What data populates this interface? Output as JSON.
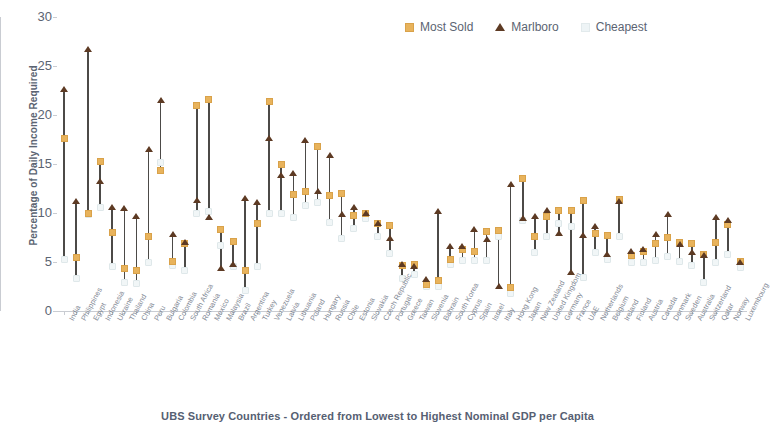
{
  "chart_data": {
    "type": "scatter",
    "title": "",
    "xlabel": "UBS Survey Countries - Ordered from Lowest to Highest Nominal GDP per Capita",
    "ylabel": "Percentage of Daily Income Required",
    "ylim": [
      0,
      30
    ],
    "yticks": [
      0,
      5,
      10,
      15,
      20,
      25,
      30
    ],
    "grid": false,
    "legend_position": "top-right",
    "colors": {
      "most_sold": "#e8b35c",
      "marlboro": "#5d3a23",
      "cheapest": "#eef4f6",
      "stem": "#4c4a47",
      "axis": "#c9ccd2",
      "text": "#5b6472"
    },
    "categories": [
      "India",
      "Philippines",
      "Egypt",
      "Indonesia",
      "Ukraine",
      "Thailand",
      "China",
      "Peru",
      "Bulgaria",
      "Colombia",
      "South Africa",
      "Romania",
      "Mexico",
      "Malaysia",
      "Brazil",
      "Argentina",
      "Turkey",
      "Venezuela",
      "Latvia",
      "Lithuania",
      "Poland",
      "Hungary",
      "Russia",
      "Chile",
      "Estonia",
      "Slovakia",
      "Czech Republic",
      "Portugal",
      "Greece",
      "Taiwan",
      "Slovenia",
      "Bahrain",
      "South Korea",
      "Cyprus",
      "Spain",
      "Israel",
      "Italy",
      "Hong Kong",
      "Japan",
      "New Zealand",
      "United Kingdom",
      "Germany",
      "France",
      "UAE",
      "Netherlands",
      "Belgium",
      "Ireland",
      "Finland",
      "Austria",
      "Canada",
      "Denmark",
      "Sweden",
      "Australia",
      "Switzerland",
      "Qatar",
      "Norway",
      "Luxembourg"
    ],
    "series": [
      {
        "name": "Marlboro",
        "marker": "triangle",
        "color": "#5d3a23",
        "values": [
          22.7,
          11.2,
          26.7,
          13.3,
          10.6,
          10.5,
          9.7,
          16.5,
          21.5,
          7.9,
          7.0,
          11.3,
          9.6,
          4.4,
          4.8,
          11.5,
          11.1,
          17.7,
          13.9,
          14.1,
          17.5,
          12.2,
          15.9,
          9.9,
          10.6,
          10.0,
          9.0,
          7.5,
          4.8,
          4.6,
          3.3,
          10.2,
          6.6,
          6.6,
          8.4,
          7.3,
          2.6,
          13.0,
          9.5,
          9.7,
          10.3,
          8.0,
          4.0,
          7.8,
          8.7,
          5.8,
          11.2,
          6.1,
          6.3,
          7.9,
          9.9,
          6.8,
          6.0,
          5.7,
          9.6,
          9.3,
          5.0
        ]
      },
      {
        "name": "Most Sold",
        "marker": "square",
        "color": "#e8b35c",
        "values": [
          17.6,
          5.5,
          10.0,
          15.3,
          8.0,
          4.3,
          4.1,
          7.6,
          14.3,
          5.1,
          6.9,
          21.0,
          21.6,
          8.3,
          7.1,
          4.1,
          8.9,
          21.4,
          14.9,
          11.9,
          12.2,
          16.8,
          11.8,
          12.0,
          9.7,
          10.0,
          8.9,
          8.7,
          4.6,
          4.7,
          2.7,
          3.1,
          5.3,
          6.3,
          6.1,
          8.1,
          8.2,
          2.4,
          13.5,
          7.6,
          9.6,
          10.3,
          10.3,
          11.3,
          7.9,
          7.7,
          11.4,
          5.7,
          6.1,
          6.9,
          7.5,
          7.0,
          6.9,
          5.8,
          7.0,
          8.8,
          5.1
        ]
      },
      {
        "name": "Cheapest",
        "marker": "square-light",
        "color": "#eef4f6",
        "values": [
          5.3,
          3.3,
          9.8,
          10.6,
          4.5,
          2.9,
          2.8,
          4.9,
          15.2,
          4.6,
          4.1,
          9.9,
          10.2,
          6.7,
          4.5,
          2.1,
          4.5,
          10.0,
          10.0,
          9.5,
          10.8,
          11.1,
          9.0,
          7.4,
          8.4,
          9.4,
          7.6,
          5.9,
          3.3,
          3.7,
          2.5,
          2.5,
          4.7,
          5.2,
          5.2,
          5.2,
          7.6,
          1.8,
          9.2,
          6.0,
          7.6,
          8.9,
          8.6,
          3.4,
          6.0,
          5.3,
          7.6,
          5.0,
          5.0,
          5.2,
          5.6,
          5.1,
          4.6,
          2.9,
          5.0,
          5.8,
          4.4
        ]
      }
    ]
  },
  "legend": {
    "items": [
      {
        "label": "Most Sold",
        "icon": "square-marker-icon"
      },
      {
        "label": "Marlboro",
        "icon": "triangle-marker-icon"
      },
      {
        "label": "Cheapest",
        "icon": "light-square-marker-icon"
      }
    ]
  },
  "axes": {
    "y_title": "Percentage of Daily Income Required",
    "x_title": "UBS Survey Countries - Ordered from Lowest to Highest Nominal GDP per Capita",
    "y_ticks": [
      "0",
      "5",
      "10",
      "15",
      "20",
      "25",
      "30"
    ]
  }
}
